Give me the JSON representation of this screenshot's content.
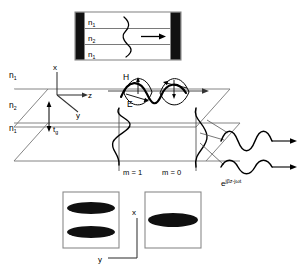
{
  "figure": {
    "colors": {
      "ink": "#000000",
      "thin_line": "#6b6b6b",
      "panel_border": "#888888",
      "end_block": "#111111",
      "mode_blob": "#101010"
    }
  },
  "top_panel": {
    "layers": [
      {
        "label": "n",
        "sub": "1"
      },
      {
        "label": "n",
        "sub": "2"
      },
      {
        "label": "n",
        "sub": "1"
      }
    ],
    "propagation_arrow": "right-arrow",
    "mode_curve": "antisymmetric-mode-curve"
  },
  "waveguide": {
    "index_labels": [
      {
        "label": "n",
        "sub": "1"
      },
      {
        "label": "n",
        "sub": "2"
      },
      {
        "label": "n",
        "sub": "1"
      }
    ],
    "axes": {
      "x": "x",
      "y": "y",
      "z": "z"
    },
    "thickness": {
      "label": "t",
      "sub": "g"
    },
    "fields": {
      "magnetic": "H",
      "electric": "E"
    },
    "modes": [
      {
        "label": "m = 1"
      },
      {
        "label": "m = 0"
      }
    ],
    "output_phase": {
      "base": "e",
      "exponent": "jβz-jωt"
    }
  },
  "mode_panels": {
    "left": {
      "lobes": 2,
      "mode": "m = 1"
    },
    "right": {
      "lobes": 1,
      "mode": "m = 0"
    },
    "axes": {
      "x": "x",
      "y": "y"
    }
  }
}
